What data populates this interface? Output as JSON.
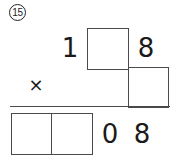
{
  "problem": {
    "number_label": "15",
    "operator_symbol": "×",
    "operation": "multiplication"
  },
  "rows": {
    "multiplicand": {
      "hundreds_digit": "1",
      "tens_box_value": "",
      "ones_digit": "8"
    },
    "multiplier": {
      "ones_box_value": ""
    },
    "product": {
      "left_box_value": "",
      "right_box_value": "",
      "tens_digit": "0",
      "ones_digit": "8"
    }
  },
  "colors": {
    "ink": "#1a1a1a",
    "box_stroke": "#4a4a4a",
    "circle_stroke": "#222222",
    "paper": "#ffffff"
  }
}
